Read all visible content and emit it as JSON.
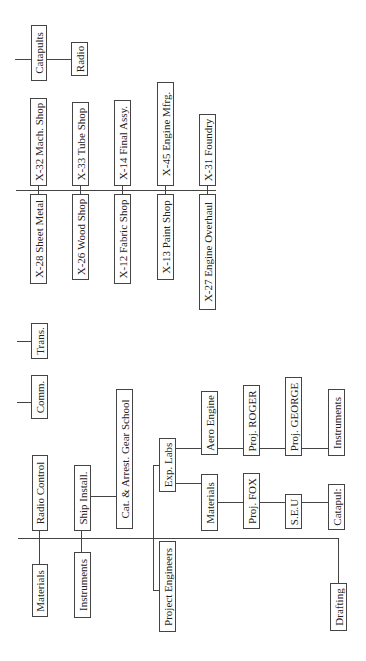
{
  "diagram": {
    "type": "org-chart",
    "orientation": "rotated-90-ccw",
    "upper_section": {
      "trunk": "main-line-upper",
      "top_row": [
        "X-32 Mach. Shop",
        "X-33 Tube Shop",
        "X-14 Final Assy.",
        "X-45 Engine Mfrg.",
        "X-31 Foundry"
      ],
      "bottom_row": [
        "X-28 Sheet Metal",
        "X-26 Wood Shop",
        "X-12 Fabric Shop",
        "X-13 Paint Shop",
        "X-27 Engine Overhaul"
      ]
    },
    "corner": {
      "catapults": "Catapults",
      "radio": "Radio"
    },
    "middle": {
      "trans": "Trans.",
      "comm": "Comm."
    },
    "lower_section": {
      "radio_control": "Radio Control",
      "materials": "Materials",
      "ship_install": "Ship Install.",
      "instruments": "Instruments",
      "cat_arrest": "Cat. & Arrest. Gear School",
      "project_engineers": "Project Engineers",
      "exp_labs": "Exp. Labs",
      "aero_engine": "Aero Engine",
      "proj_roger": "Proj. ROGER",
      "proj_george": "Proj. GEORGE",
      "instruments2": "Instruments",
      "materials2": "Materials",
      "proj_fox": "Proj. FOX",
      "seu": "S.E.U",
      "catapul": "Catapul:",
      "drafting": "Drafting"
    },
    "line_color": "#444444",
    "background": "#ffffff"
  }
}
